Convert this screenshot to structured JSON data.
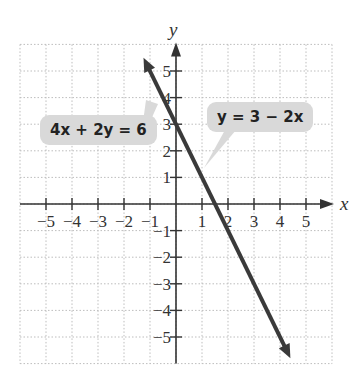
{
  "chart_data": {
    "type": "line",
    "title": "",
    "xlabel": "x",
    "ylabel": "y",
    "xlim": [
      -6,
      6
    ],
    "ylim": [
      -6,
      6
    ],
    "grid": true,
    "x_ticks": [
      -5,
      -4,
      -3,
      -2,
      -1,
      1,
      2,
      3,
      4,
      5
    ],
    "y_ticks": [
      -5,
      -4,
      -3,
      -2,
      -1,
      1,
      2,
      3,
      4,
      5
    ],
    "series": [
      {
        "name": "y = 3 − 2x",
        "equation": "y = 3 - 2x",
        "slope": -2,
        "intercept": 3,
        "x": [
          -1.25,
          4.4
        ],
        "y": [
          5.5,
          -5.8
        ],
        "color": "#3a3a3a"
      }
    ],
    "annotations": [
      {
        "text": "4x + 2y = 6",
        "points_to": [
          0,
          4.5
        ]
      },
      {
        "text": "y = 3 − 2x",
        "points_to": [
          1.1,
          0.8
        ]
      }
    ]
  },
  "labels": {
    "x_axis": "x",
    "y_axis": "y",
    "callout_left": "4x + 2y = 6",
    "callout_right": "y = 3 − 2x",
    "x_tick_labels": [
      "−5",
      "−4",
      "−3",
      "−2",
      "−1",
      "1",
      "2",
      "3",
      "4",
      "5"
    ],
    "y_tick_labels": [
      "5",
      "4",
      "3",
      "2",
      "1",
      "−1",
      "−2",
      "−3",
      "−4",
      "−5"
    ]
  }
}
